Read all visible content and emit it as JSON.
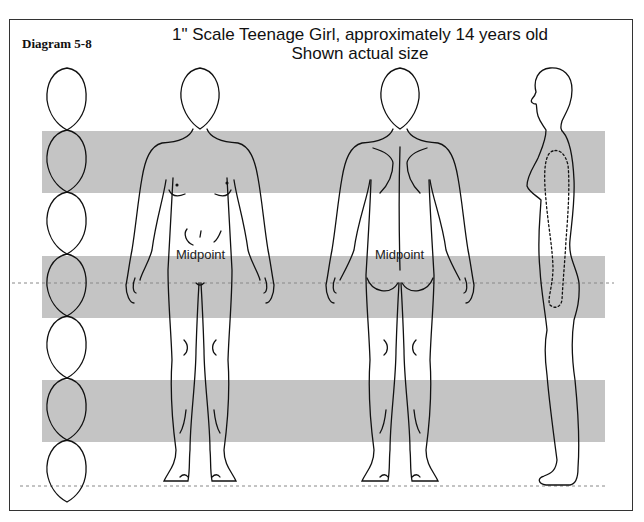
{
  "diagram": {
    "label": "Diagram 5-8",
    "title_line1": "1\" Scale Teenage Girl, approximately 14 years old",
    "title_line2": "Shown actual size",
    "head_count": 7,
    "head_unit_px": 62,
    "figures": [
      {
        "view": "front",
        "midpoint_label": "Midpoint"
      },
      {
        "view": "back",
        "midpoint_label": "Midpoint"
      },
      {
        "view": "side",
        "midpoint_label": ""
      }
    ],
    "bands": [
      {
        "top": 131,
        "height": 62
      },
      {
        "top": 256,
        "height": 62
      },
      {
        "top": 380,
        "height": 62
      }
    ],
    "guide_lines": [
      {
        "name": "midpoint-line",
        "y": 283
      },
      {
        "name": "ground-line",
        "y": 483
      }
    ],
    "colors": {
      "band": "#c4c4c4",
      "line": "#111111",
      "dashed": "#888888",
      "border": "#333333"
    }
  }
}
